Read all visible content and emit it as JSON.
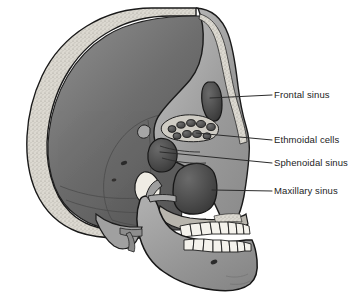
{
  "figure": {
    "name": "sagittal-skull-paranasal-sinuses",
    "background_color": "#ffffff",
    "width": 359,
    "height": 307
  },
  "labels": [
    {
      "id": "frontal",
      "text": "Frontal sinus",
      "text_x": 274,
      "text_y": 90,
      "leader": {
        "x1": 272,
        "y1": 95,
        "x2": 210,
        "y2": 98
      }
    },
    {
      "id": "ethmoidal",
      "text": "Ethmoidal cells",
      "text_x": 274,
      "text_y": 135,
      "leader": {
        "x1": 272,
        "y1": 140,
        "x2": 196,
        "y2": 133
      }
    },
    {
      "id": "sphenoidal",
      "text": "Sphenoidal sinus",
      "text_x": 274,
      "text_y": 158,
      "leader": {
        "x1": 272,
        "y1": 163,
        "x2": 160,
        "y2": 152
      }
    },
    {
      "id": "maxillary",
      "text": "Maxillary sinus",
      "text_x": 274,
      "text_y": 186,
      "leader": {
        "x1": 272,
        "y1": 191,
        "x2": 212,
        "y2": 190
      }
    }
  ],
  "colors": {
    "outline": "#1a1a1a",
    "label_text": "#232323",
    "leader_line": "#2b2b2b",
    "diploe_bone": "#d9d6cf",
    "cranial_cavity_light": "#7b7b7b",
    "cranial_cavity_dark": "#575757",
    "facial_bone_light": "#b3b3b3",
    "facial_bone_mid": "#8e8e8e",
    "mandible": "#9a9a9a",
    "sinus_cavity_dark": "#4a4a4a",
    "sinus_cavity_deep": "#3a3a3a",
    "tooth_enamel": "#f4f2ec",
    "background": "#ffffff"
  },
  "anatomy": {
    "structures": [
      "calvaria",
      "diploe",
      "cranial-cavity",
      "frontal-sinus",
      "ethmoidal-air-cells",
      "sphenoidal-sinus",
      "maxillary-sinus",
      "orbit",
      "nasal-cavity",
      "maxilla",
      "mandible",
      "upper-teeth",
      "lower-teeth",
      "mastoid-process",
      "zygomatic-arch",
      "mental-foramen"
    ],
    "ethmoidal_cell_count": 9,
    "upper_teeth_count": 8,
    "lower_teeth_count": 8
  }
}
